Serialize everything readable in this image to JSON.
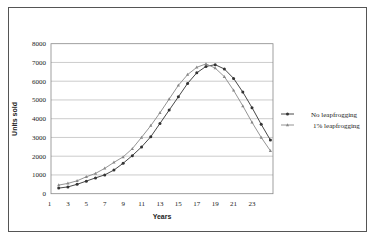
{
  "chart_data": {
    "type": "line",
    "title": "",
    "xlabel": "Years",
    "ylabel": "Units sold",
    "x": [
      2,
      3,
      4,
      5,
      6,
      7,
      8,
      9,
      10,
      11,
      12,
      13,
      14,
      15,
      16,
      17,
      18,
      19,
      20,
      21,
      22,
      23,
      24,
      25
    ],
    "x_ticks": [
      "1",
      "3",
      "5",
      "7",
      "9",
      "11",
      "13",
      "15",
      "17",
      "19",
      "21",
      "23"
    ],
    "y_ticks": [
      "0",
      "1000",
      "2000",
      "3000",
      "4000",
      "5000",
      "6000",
      "7000",
      "8000"
    ],
    "ylim": [
      0,
      8000
    ],
    "xlim": [
      1,
      25.5
    ],
    "grid": "horizontal",
    "legend_position": "right",
    "series": [
      {
        "name": "No leapfrogging",
        "marker": "circle",
        "color": "#333333",
        "values": [
          300,
          360,
          500,
          670,
          840,
          1000,
          1260,
          1620,
          2030,
          2490,
          3040,
          3750,
          4460,
          5170,
          5880,
          6450,
          6790,
          6880,
          6650,
          6150,
          5420,
          4590,
          3700,
          2860
        ]
      },
      {
        "name": "1% leapfrogging",
        "marker": "triangle",
        "color": "#888888",
        "values": [
          460,
          550,
          690,
          900,
          1080,
          1350,
          1670,
          1960,
          2400,
          3000,
          3630,
          4320,
          5050,
          5780,
          6350,
          6740,
          6920,
          6700,
          6240,
          5510,
          4680,
          3810,
          3000,
          2290
        ]
      }
    ]
  }
}
